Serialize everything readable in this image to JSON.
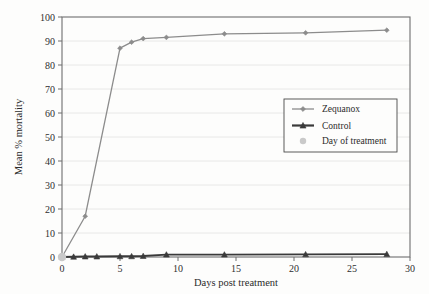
{
  "chart_data": {
    "type": "line",
    "title": "",
    "xlabel": "Days post treatment",
    "ylabel": "Mean % mortality",
    "xlim": [
      0,
      30
    ],
    "ylim": [
      0,
      100
    ],
    "xticks": [
      0,
      5,
      10,
      15,
      20,
      25,
      30
    ],
    "yticks": [
      0,
      10,
      20,
      30,
      40,
      50,
      60,
      70,
      80,
      90,
      100
    ],
    "xtick_labels": [
      "0",
      "5",
      "10",
      "15",
      "20",
      "25",
      "30"
    ],
    "ytick_labels": [
      "0",
      "10",
      "20",
      "30",
      "40",
      "50",
      "60",
      "70",
      "80",
      "90",
      "100"
    ],
    "grid": "horizontal",
    "legend_position": "center-right",
    "series": [
      {
        "name": "Zequanox",
        "marker": "diamond",
        "color": "#8c8c8c",
        "x": [
          0,
          2,
          5,
          6,
          7,
          9,
          14,
          21,
          28
        ],
        "values": [
          0,
          17,
          87,
          89.5,
          91,
          91.5,
          93,
          93.4,
          94.5
        ]
      },
      {
        "name": "Control",
        "marker": "triangle",
        "color": "#3a3a3a",
        "x": [
          0,
          1,
          2,
          3,
          5,
          6,
          7,
          9,
          14,
          21,
          28
        ],
        "values": [
          0,
          0.1,
          0.2,
          0.2,
          0.3,
          0.3,
          0.4,
          1.0,
          1.0,
          1.1,
          1.2
        ]
      },
      {
        "name": "Day of treatment",
        "marker": "circle",
        "color": "#c9c9c9",
        "x": [
          0
        ],
        "values": [
          0
        ]
      }
    ]
  },
  "legend": {
    "items": [
      {
        "label": "Zequanox",
        "marker": "diamond-line",
        "color": "#8c8c8c"
      },
      {
        "label": "Control",
        "marker": "triangle-line",
        "color": "#3a3a3a"
      },
      {
        "label": "Day of treatment",
        "marker": "circle-dot",
        "color": "#c9c9c9"
      }
    ]
  },
  "colors": {
    "zequanox": "#8c8c8c",
    "control": "#3a3a3a",
    "day_of_treatment": "#c9c9c9",
    "axis": "#6e6e6e",
    "grid": "#e2e2e2",
    "background": "#fdfdfc",
    "text": "#2b2b2b"
  }
}
